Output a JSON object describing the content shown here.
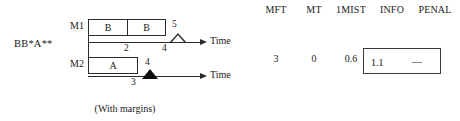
{
  "diagram": {
    "expression_label": "BB*A**",
    "caption": "(With margins)",
    "machines": [
      {
        "name": "M1",
        "tasks": [
          {
            "label": "B"
          },
          {
            "label": "B"
          }
        ],
        "axis_label": "Time",
        "ticks": [
          {
            "value": "2"
          },
          {
            "value": "4"
          },
          {
            "value": "5"
          }
        ],
        "marker": "open-triangle-marker"
      },
      {
        "name": "M2",
        "tasks": [
          {
            "label": "A"
          }
        ],
        "axis_label": "Time",
        "ticks": [
          {
            "value": "3"
          },
          {
            "value": "4"
          }
        ],
        "marker": "filled-triangle-marker"
      }
    ]
  },
  "metrics": {
    "columns": [
      {
        "header": "MFT",
        "value": "3"
      },
      {
        "header": "MT",
        "value": "0"
      },
      {
        "header": "1MIST",
        "value": "0.6"
      },
      {
        "header": "INFO",
        "value": "1.1"
      },
      {
        "header": "PENAL",
        "value": "—"
      }
    ]
  },
  "colors": {
    "stroke": "#2b2b2b",
    "marker_filled": "#0d0d0d",
    "background": "#ffffff",
    "box_border": "#3a3a3a"
  }
}
